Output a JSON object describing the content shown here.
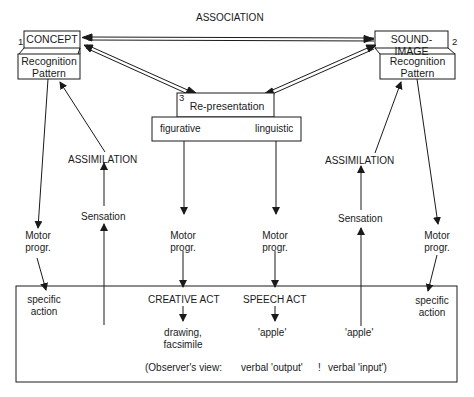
{
  "diagram": {
    "association_label": "ASSOCIATION",
    "concept": {
      "number": "1",
      "label": "CONCEPT",
      "pattern": "Recognition\nPattern"
    },
    "sound_image": {
      "number": "2",
      "label": "SOUND-IMAGE",
      "pattern": "Recognition\nPattern"
    },
    "representation": {
      "number": "3",
      "label": "Re-presentation",
      "left": "figurative",
      "right": "linguistic"
    },
    "left_column": {
      "assimilation": "ASSIMILATION",
      "sensation": "Sensation",
      "motor_outer": "Motor\nprogr.",
      "motor_inner": "Motor\nprogr."
    },
    "right_column": {
      "assimilation": "ASSIMILATION",
      "sensation": "Sensation",
      "motor_outer": "Motor\nprogr.",
      "motor_inner": "Motor\nprogr."
    },
    "bottom_box": {
      "left_action": "specific\naction",
      "right_action": "specific\naction",
      "creative_act": "CREATIVE ACT",
      "speech_act": "SPEECH ACT",
      "drawing": "drawing,\nfacsimile",
      "apple_output": "'apple'",
      "apple_input": "'apple'",
      "observer_view": "(Observer's view:",
      "verbal_output": "verbal 'output'",
      "separator": "!",
      "verbal_input": "verbal 'input')"
    },
    "colors": {
      "ink": "#1a1a1a",
      "background": "#ffffff"
    }
  }
}
